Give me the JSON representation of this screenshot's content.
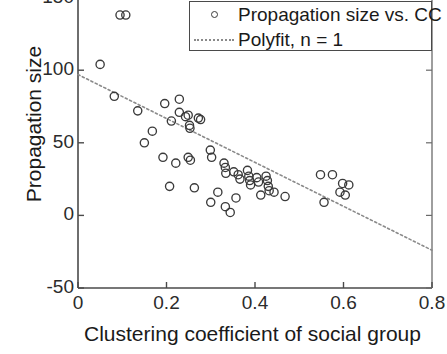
{
  "chart_data": {
    "type": "scatter",
    "title": "",
    "xlabel": "Clustering coefficient of social group",
    "ylabel": "Propagation size",
    "xlim": [
      0,
      0.8
    ],
    "ylim": [
      -50,
      150
    ],
    "xticks": [
      "0",
      "0.2",
      "0.4",
      "0.6",
      "0.8"
    ],
    "xtick_values": [
      0,
      0.2,
      0.4,
      0.6,
      0.8
    ],
    "yticks": [
      "150",
      "100",
      "50",
      "0",
      "-50"
    ],
    "ytick_values": [
      150,
      100,
      50,
      0,
      -50
    ],
    "grid": false,
    "legend_position": "top-right",
    "series": [
      {
        "name": "Propagation size vs. CC",
        "type": "scatter",
        "marker": "circle-open",
        "color": "#3a3a3a",
        "points": [
          [
            0.095,
            138
          ],
          [
            0.108,
            138
          ],
          [
            0.05,
            104
          ],
          [
            0.082,
            82
          ],
          [
            0.135,
            72
          ],
          [
            0.196,
            77
          ],
          [
            0.229,
            80
          ],
          [
            0.229,
            71
          ],
          [
            0.211,
            65
          ],
          [
            0.243,
            68
          ],
          [
            0.249,
            69
          ],
          [
            0.252,
            62
          ],
          [
            0.253,
            60
          ],
          [
            0.272,
            67
          ],
          [
            0.277,
            66
          ],
          [
            0.168,
            58
          ],
          [
            0.15,
            50
          ],
          [
            0.192,
            40
          ],
          [
            0.221,
            36
          ],
          [
            0.249,
            40
          ],
          [
            0.254,
            38
          ],
          [
            0.299,
            45
          ],
          [
            0.302,
            40
          ],
          [
            0.33,
            36
          ],
          [
            0.333,
            33
          ],
          [
            0.334,
            29
          ],
          [
            0.352,
            30
          ],
          [
            0.362,
            28
          ],
          [
            0.366,
            25
          ],
          [
            0.383,
            31
          ],
          [
            0.386,
            27
          ],
          [
            0.388,
            24
          ],
          [
            0.39,
            21
          ],
          [
            0.404,
            26
          ],
          [
            0.408,
            23
          ],
          [
            0.425,
            27
          ],
          [
            0.428,
            24
          ],
          [
            0.43,
            20
          ],
          [
            0.432,
            17
          ],
          [
            0.316,
            16
          ],
          [
            0.357,
            12
          ],
          [
            0.413,
            14
          ],
          [
            0.443,
            16
          ],
          [
            0.468,
            13
          ],
          [
            0.548,
            28
          ],
          [
            0.575,
            28
          ],
          [
            0.598,
            22
          ],
          [
            0.612,
            21
          ],
          [
            0.592,
            16
          ],
          [
            0.556,
            9
          ],
          [
            0.604,
            14
          ],
          [
            0.3,
            9
          ],
          [
            0.333,
            6
          ],
          [
            0.344,
            2
          ],
          [
            0.263,
            19
          ],
          [
            0.207,
            20
          ]
        ]
      },
      {
        "name": "Polyfit, n = 1",
        "type": "line",
        "style": "dotted",
        "color": "#8a8a8a",
        "endpoints": [
          [
            0.0,
            97
          ],
          [
            0.8,
            -24
          ]
        ],
        "slope": -151.25,
        "intercept": 97
      }
    ]
  },
  "legend": {
    "entries": [
      {
        "label": "Propagation size vs. CC",
        "symbol": "marker-circle-open"
      },
      {
        "label": "Polyfit, n = 1",
        "symbol": "dotted-line"
      }
    ]
  },
  "axes": {
    "xlabel": "Clustering coefficient of social group",
    "ylabel": "Propagation size",
    "xticks": [
      "0",
      "0.2",
      "0.4",
      "0.6",
      "0.8"
    ],
    "yticks": [
      "150",
      "100",
      "50",
      "0",
      "-50"
    ]
  }
}
